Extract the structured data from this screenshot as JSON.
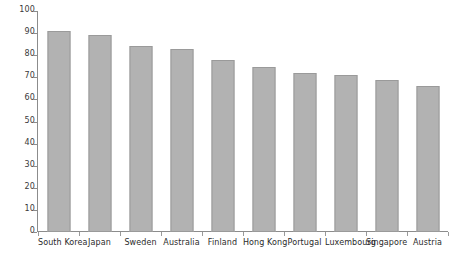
{
  "chart_data": {
    "type": "bar",
    "title": "",
    "xlabel": "",
    "ylabel": "",
    "ylim": [
      0,
      100
    ],
    "yticks": [
      0,
      10,
      20,
      30,
      40,
      50,
      60,
      70,
      80,
      90,
      100
    ],
    "ytick_labels": [
      "0",
      "10",
      "20",
      "30",
      "40",
      "50",
      "60",
      "70",
      "80",
      "90",
      "100"
    ],
    "grid": false,
    "legend": false,
    "legend_position": "none",
    "bar_color": "#b2b2b2",
    "bar_edge_color": "#9a9a9a",
    "axis_color": "#8c8c8c",
    "categories": [
      "South Korea",
      "Japan",
      "Sweden",
      "Australia",
      "Finland",
      "Hong Kong",
      "Portugal",
      "Luxembourg",
      "Singapore",
      "Austria"
    ],
    "values": [
      91,
      89,
      84,
      83,
      78,
      74.5,
      72,
      71,
      69,
      66
    ]
  }
}
